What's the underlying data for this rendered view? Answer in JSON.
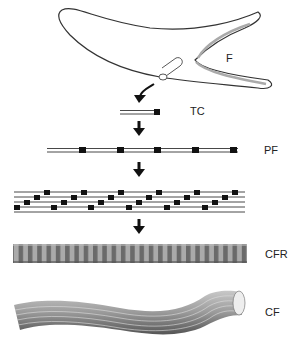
{
  "diagram": {
    "type": "collagen-fiber-assembly-hierarchy",
    "labels": {
      "fibroblast": "F",
      "tropocollagen": "TC",
      "protofibril": "PF",
      "collagen_fibril": "CFR",
      "collagen_fiber": "CF"
    },
    "stages": [
      "F",
      "TC",
      "PF",
      "staggered protofibrils",
      "CFR",
      "CF"
    ],
    "colors": {
      "stroke": "#222222",
      "block": "#111111",
      "fibril_light": "#aaaaaa",
      "fibril_dark": "#666666",
      "fiber": "#9a9a9a"
    }
  }
}
